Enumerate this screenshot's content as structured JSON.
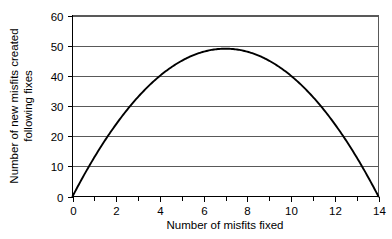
{
  "chart_data": {
    "type": "line",
    "title": "",
    "xlabel": "Number of misfits fixed",
    "ylabel": "Number of new misfits created following fixes",
    "ylabel_lines": [
      "Number of new misfits created",
      "following fixes"
    ],
    "xlim": [
      0,
      14
    ],
    "ylim": [
      0,
      60
    ],
    "grid": true,
    "grid_axis": "y",
    "legend": false,
    "legend_position": "none",
    "xticks": [
      0,
      2,
      4,
      6,
      8,
      10,
      12,
      14
    ],
    "xtick_labels": [
      "0",
      "2",
      "4",
      "6",
      "8",
      "10",
      "12",
      "14"
    ],
    "xminor_ticks": [
      1,
      3,
      5,
      7,
      9,
      11,
      13
    ],
    "yticks": [
      0,
      10,
      20,
      30,
      40,
      50,
      60
    ],
    "ytick_labels": [
      "0",
      "10",
      "20",
      "30",
      "40",
      "50",
      "60"
    ],
    "series": [
      {
        "name": "new misfits created",
        "color": "#000000",
        "x": [
          0,
          0.5,
          1,
          1.5,
          2,
          2.5,
          3,
          3.5,
          4,
          4.5,
          5,
          5.5,
          6,
          6.5,
          7,
          7.5,
          8,
          8.5,
          9,
          9.5,
          10,
          10.5,
          11,
          11.5,
          12,
          12.5,
          13,
          13.5,
          14
        ],
        "values": [
          0,
          6.6,
          12.8,
          18.6,
          24,
          29,
          33.6,
          37.8,
          41.6,
          45,
          48,
          48.8,
          49,
          49.2,
          49.0,
          48.8,
          48,
          45,
          41.6,
          37.8,
          33.6,
          29,
          24,
          18.6,
          12.8,
          6.6,
          4.4,
          2.2,
          0
        ]
      }
    ],
    "peak": {
      "x": 7,
      "y": 49
    },
    "zeros": [
      0,
      14
    ],
    "colors": {
      "curve": "#000000",
      "gridline": "#595959",
      "axis": "#000000",
      "background": "#ffffff"
    }
  }
}
